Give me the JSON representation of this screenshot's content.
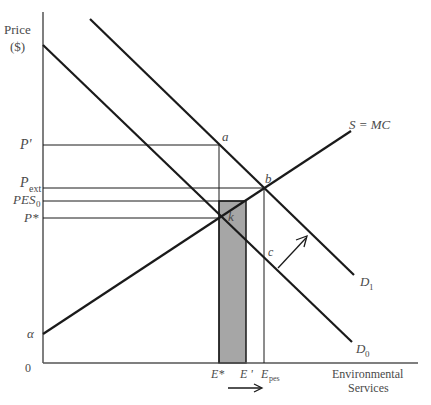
{
  "diagram": {
    "title_cutoff": "",
    "y_axis": {
      "label_line1": "Price",
      "label_line2": "($)"
    },
    "x_axis": {
      "label_line1": "Environmental",
      "label_line2": "Services",
      "origin": "0"
    },
    "price_labels": {
      "p_prime": "P'",
      "p_ext": "P",
      "p_ext_sub": "ext",
      "pes0": "PES",
      "pes0_sub": "0",
      "p_star": "P*",
      "alpha": "α"
    },
    "quantity_labels": {
      "e_star": "E*",
      "e_prime": "E '",
      "e_pes": "E",
      "e_pes_sub": "pes"
    },
    "point_labels": {
      "a": "a",
      "b": "b",
      "c": "c",
      "k": "k"
    },
    "curve_labels": {
      "supply": "S = MC",
      "d1": "D",
      "d1_sub": "1",
      "d0": "D",
      "d0_sub": "0"
    },
    "colors": {
      "line": "#1a1a1a",
      "axis": "#555555",
      "shade": "#a6a6a6",
      "text": "#4a4a4a"
    }
  }
}
